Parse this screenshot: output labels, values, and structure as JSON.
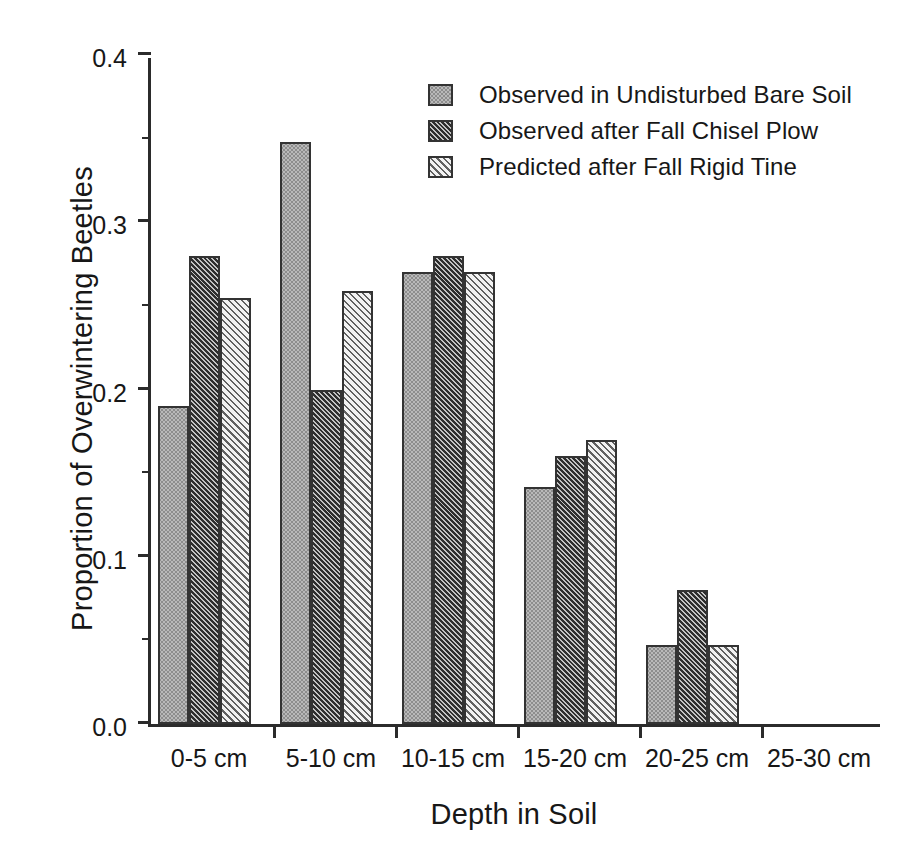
{
  "chart_data": {
    "type": "bar",
    "title": "",
    "xlabel": "Depth in Soil",
    "ylabel": "Proportion of Overwintering Beetles",
    "categories": [
      "0-5 cm",
      "5-10 cm",
      "10-15 cm",
      "15-20 cm",
      "20-25 cm",
      "25-30 cm"
    ],
    "series": [
      {
        "name": "Observed in Undisturbed Bare Soil",
        "pattern": "light-grey-stipple",
        "values": [
          0.19,
          0.348,
          0.27,
          0.142,
          0.047,
          0.0
        ]
      },
      {
        "name": "Observed after Fall Chisel Plow",
        "pattern": "dark-diagonal-hatch",
        "values": [
          0.28,
          0.2,
          0.28,
          0.16,
          0.08,
          0.0
        ]
      },
      {
        "name": "Predicted after Fall Rigid Tine",
        "pattern": "white-diagonal-hatch",
        "values": [
          0.255,
          0.259,
          0.27,
          0.17,
          0.047,
          0.0
        ]
      }
    ],
    "ylim": [
      0.0,
      0.4
    ],
    "y_major_ticks": [
      0.0,
      0.1,
      0.2,
      0.3,
      0.4
    ],
    "y_major_tick_labels": [
      "0.0",
      "0.1",
      "0.2",
      "0.3",
      "0.4"
    ],
    "y_minor_ticks": [
      0.05,
      0.15,
      0.25,
      0.35
    ],
    "grid": false,
    "legend_position": "top-center-right"
  }
}
